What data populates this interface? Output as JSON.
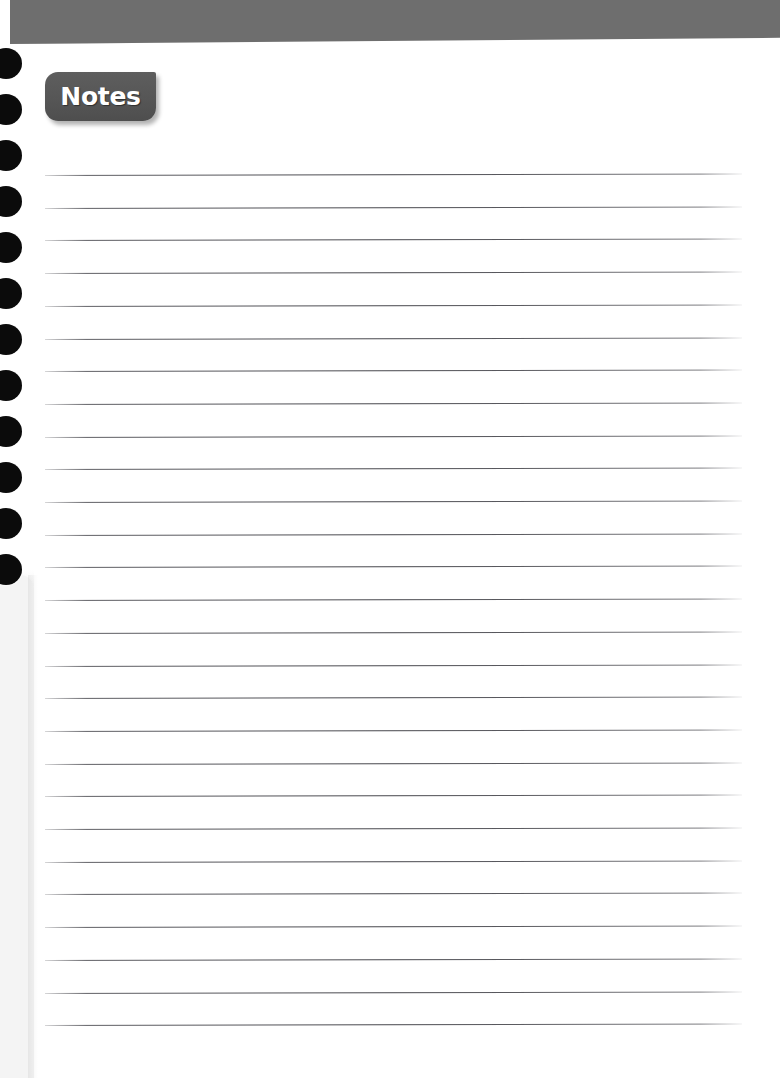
{
  "page": {
    "title": "Notes",
    "width": 780,
    "height": 1078,
    "background_color": "#ffffff"
  },
  "header": {
    "name": "header-band",
    "color": "#6e6e6e",
    "height": 44
  },
  "tab": {
    "label": "Notes",
    "background_color": "#575757",
    "text_color": "#ffffff",
    "left": 45,
    "top": 72,
    "width": 111,
    "height": 49
  },
  "binding": {
    "hole_color": "#0b0b0b",
    "hole_count": 12,
    "first_hole_y": 48,
    "hole_spacing": 46,
    "hole_width": 32,
    "hole_height": 31
  },
  "page_edge": {
    "color": "#f4f4f4",
    "top": 575,
    "width": 34
  },
  "rules": {
    "line_color": "#46464c",
    "count": 27,
    "first_line_y": 175,
    "spacing": 32.7,
    "left": 45,
    "width": 697,
    "slope_deg": -0.12
  },
  "content": {
    "lines": [
      "",
      "",
      "",
      "",
      "",
      "",
      "",
      "",
      "",
      "",
      "",
      "",
      "",
      "",
      "",
      "",
      "",
      "",
      "",
      "",
      "",
      "",
      "",
      "",
      "",
      "",
      ""
    ]
  }
}
